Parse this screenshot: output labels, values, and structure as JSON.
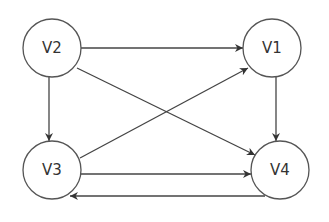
{
  "diagram": {
    "type": "directed-graph",
    "nodes": [
      {
        "id": "V2",
        "label": "V2",
        "cx": 52,
        "cy": 48,
        "r": 29
      },
      {
        "id": "V1",
        "label": "V1",
        "cx": 272,
        "cy": 48,
        "r": 29
      },
      {
        "id": "V3",
        "label": "V3",
        "cx": 52,
        "cy": 170,
        "r": 29
      },
      {
        "id": "V4",
        "label": "V4",
        "cx": 280,
        "cy": 170,
        "r": 29
      }
    ],
    "edges": [
      {
        "from": "V2",
        "to": "V1"
      },
      {
        "from": "V2",
        "to": "V3"
      },
      {
        "from": "V2",
        "to": "V4"
      },
      {
        "from": "V3",
        "to": "V1"
      },
      {
        "from": "V3",
        "to": "V4"
      },
      {
        "from": "V4",
        "to": "V3"
      },
      {
        "from": "V1",
        "to": "V4"
      }
    ],
    "colors": {
      "stroke": "#444444",
      "node_fill": "#ffffff",
      "text": "#333333"
    }
  }
}
